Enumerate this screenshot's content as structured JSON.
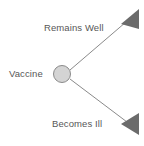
{
  "diagram": {
    "type": "decision-tree",
    "background_color": "#ffffff",
    "root_node": {
      "icon": "circle-node-icon",
      "label": "Vaccine",
      "shape": "circle",
      "fill_color": "#d4d4d4",
      "stroke_color": "#8a8a8a",
      "center_x": 62,
      "center_y": 74,
      "radius": 9
    },
    "branches": [
      {
        "id": "remains-well",
        "label": "Remains Well",
        "direction": "up-right",
        "line_color": "#8a8a8a",
        "arrow_icon": "triangle-arrowhead-icon",
        "arrow_color": "#6b6b6b",
        "line_from": [
          70,
          70
        ],
        "line_to": [
          126,
          22
        ],
        "arrow_apex": [
          121,
          24
        ],
        "arrow_edge_top": [
          139,
          9
        ],
        "arrow_edge_bottom": [
          139,
          29
        ]
      },
      {
        "id": "becomes-ill",
        "label": "Becomes Ill",
        "direction": "down-right",
        "line_color": "#8a8a8a",
        "arrow_icon": "triangle-arrowhead-icon",
        "arrow_color": "#6b6b6b",
        "line_from": [
          70,
          79
        ],
        "line_to": [
          127,
          122
        ],
        "arrow_apex": [
          121,
          124
        ],
        "arrow_edge_top": [
          139,
          113
        ],
        "arrow_edge_bottom": [
          139,
          135
        ]
      }
    ],
    "text_color": "#575757"
  }
}
